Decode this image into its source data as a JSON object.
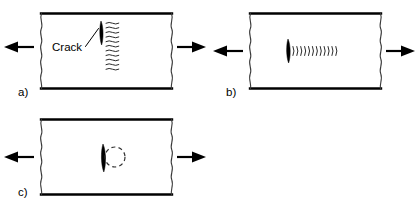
{
  "figure": {
    "background_color": "#ffffff",
    "line_color": "#000000",
    "width": 418,
    "height": 212
  },
  "panels": [
    {
      "id": "panel-a",
      "label": "a)",
      "label_x": 18,
      "label_y": 96,
      "rect": {
        "x": 41,
        "y": 13,
        "width": 131,
        "height": 76
      },
      "annotation": {
        "text": "Crack",
        "x": 52,
        "y": 51,
        "leader_from_x": 85,
        "leader_from_y": 47,
        "leader_to_x": 98,
        "leader_to_y": 29
      },
      "crack": {
        "type": "vertical-crack-with-hatching",
        "x": 101,
        "y_top": 21,
        "y_bottom": 45,
        "half_width": 2.2
      },
      "hatching": {
        "type": "stacked-tilde-rows",
        "count": 11,
        "x_start": 106,
        "x_end": 119,
        "y_start": 23,
        "y_spacing": 4.6,
        "description": "horizontal wavy hatch marks right of crack"
      },
      "arrows": [
        {
          "direction": "left",
          "tip_x": 4,
          "tail_x": 34,
          "y": 47
        },
        {
          "direction": "right",
          "tip_x": 206,
          "tail_x": 177,
          "y": 47
        }
      ]
    },
    {
      "id": "panel-b",
      "label": "b)",
      "label_x": 226,
      "label_y": 96,
      "rect": {
        "x": 250,
        "y": 13,
        "width": 131,
        "height": 76
      },
      "annotation": null,
      "crack": {
        "type": "lens-shaped-vertical-crack",
        "x": 288,
        "y_top": 39,
        "y_bottom": 63,
        "half_width": 2.4
      },
      "hatching": {
        "type": "horizontal-arc-row",
        "count": 12,
        "x_start": 293,
        "x_spacing": 3.9,
        "y_center": 51,
        "arc_height": 9,
        "description": "row of right-opening arcs extending from crack tip"
      },
      "arrows": [
        {
          "direction": "left",
          "tip_x": 213,
          "tail_x": 243,
          "y": 51
        },
        {
          "direction": "right",
          "tip_x": 415,
          "tail_x": 386,
          "y": 51
        }
      ]
    },
    {
      "id": "panel-c",
      "label": "c)",
      "label_x": 18,
      "label_y": 196,
      "rect": {
        "x": 41,
        "y": 119,
        "width": 131,
        "height": 76
      },
      "annotation": null,
      "crack": {
        "type": "lens-shaped-vertical-crack",
        "x": 103,
        "y_top": 144,
        "y_bottom": 172,
        "half_width": 2.6
      },
      "plastic_zone": {
        "type": "dashed-circle",
        "center_x": 115,
        "center_y": 157,
        "radius": 10,
        "description": "dashed circular plastic zone at crack tip"
      },
      "arrows": [
        {
          "direction": "left",
          "tip_x": 4,
          "tail_x": 34,
          "y": 157
        },
        {
          "direction": "right",
          "tip_x": 206,
          "tail_x": 177,
          "y": 157
        }
      ]
    }
  ]
}
